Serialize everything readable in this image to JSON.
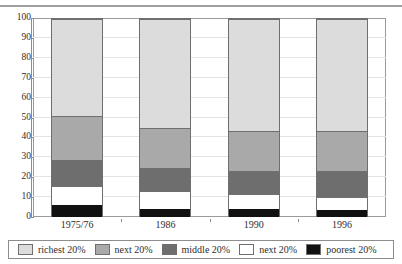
{
  "chart_data": {
    "type": "bar",
    "subtype": "stacked-100-percent",
    "title": "",
    "xlabel": "",
    "ylabel": "",
    "categories": [
      "1975/76",
      "1986",
      "1990",
      "1996"
    ],
    "ylim": [
      0,
      100
    ],
    "yticks": [
      0,
      10,
      20,
      30,
      40,
      50,
      60,
      70,
      80,
      90,
      100
    ],
    "grid": true,
    "grid_axis": "y",
    "legend_position": "bottom",
    "stack_order_bottom_to_top": [
      "poorest 20%",
      "next 20%",
      "middle 20%",
      "next 20%",
      "richest 20%"
    ],
    "series": [
      {
        "name": "poorest 20%",
        "color": "#111111",
        "values": [
          6,
          4,
          4,
          3.5
        ]
      },
      {
        "name": "next 20%",
        "color": "#ffffff",
        "values": [
          9.5,
          9,
          7.5,
          6.5
        ]
      },
      {
        "name": "middle 20%",
        "color": "#6e6e6e",
        "values": [
          13.5,
          11.5,
          11.5,
          13
        ]
      },
      {
        "name": "next 20%",
        "color": "#a9a9a9",
        "values": [
          22,
          20.5,
          20.5,
          20.5
        ]
      },
      {
        "name": "richest 20%",
        "color": "#dcdcdc",
        "values": [
          49,
          55,
          56.5,
          56.5
        ]
      }
    ],
    "cumulative_tops": {
      "1975/76": [
        6,
        15.5,
        29,
        51,
        100
      ],
      "1986": [
        4,
        13,
        24.5,
        45,
        100
      ],
      "1990": [
        4,
        11.5,
        23,
        43.5,
        100
      ],
      "1996": [
        3.5,
        10,
        23,
        43.5,
        100
      ]
    },
    "legend": [
      {
        "label": "richest 20%",
        "color": "#dcdcdc"
      },
      {
        "label": "next 20%",
        "color": "#a9a9a9"
      },
      {
        "label": "middle 20%",
        "color": "#6e6e6e"
      },
      {
        "label": "next 20%",
        "color": "#ffffff"
      },
      {
        "label": "poorest 20%",
        "color": "#111111"
      }
    ],
    "colors": {
      "axis": "#8d8d8d",
      "grid": "#e3e3e3",
      "frame": "#9a9a9a",
      "bar_outline": "#6f6f6f",
      "text": "#2e2e2e",
      "background": "#ffffff"
    }
  }
}
